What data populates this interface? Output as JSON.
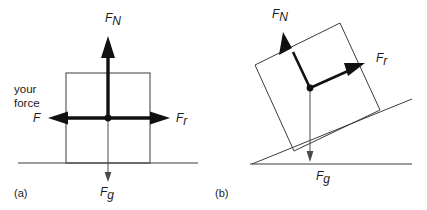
{
  "figure": {
    "background_color": "#ffffff",
    "line_color": "#3b3b3b",
    "bold_arrow_color": "#111111",
    "text_color": "#1a1a1a"
  },
  "panel_a": {
    "tag": "(a)",
    "description": "Box resting on horizontal ground with four forces",
    "annotation_line1": "your",
    "annotation_line2": "force",
    "forces": [
      {
        "id": "normal",
        "symbol": "F",
        "subscript": "N",
        "direction": "up",
        "style": "bold",
        "label_x": 105,
        "label_y": 22
      },
      {
        "id": "applied",
        "symbol": "F",
        "subscript": "",
        "direction": "left",
        "style": "bold",
        "label_x": 33,
        "label_y": 122
      },
      {
        "id": "friction",
        "symbol": "F",
        "subscript": "r",
        "direction": "right",
        "style": "bold",
        "label_x": 176,
        "label_y": 122
      },
      {
        "id": "gravity",
        "symbol": "F",
        "subscript": "g",
        "direction": "down",
        "style": "thin",
        "label_x": 100,
        "label_y": 196
      }
    ],
    "geometry": {
      "box_left": 66,
      "box_top": 73,
      "box_right": 150,
      "box_bottom": 163,
      "center_x": 108,
      "center_y": 118,
      "ground_y": 163,
      "ground_x_start": 18,
      "ground_x_end": 198
    }
  },
  "panel_b": {
    "tag": "(b)",
    "description": "Box on an inclined plane with three forces",
    "incline_angle_deg": 26,
    "forces": [
      {
        "id": "normal",
        "symbol": "F",
        "subscript": "N",
        "direction": "perpendicular-to-incline",
        "style": "bold",
        "label_x": 272,
        "label_y": 18
      },
      {
        "id": "friction",
        "symbol": "F",
        "subscript": "r",
        "direction": "up-slope",
        "style": "bold",
        "label_x": 376,
        "label_y": 62
      },
      {
        "id": "gravity",
        "symbol": "F",
        "subscript": "g",
        "direction": "down",
        "style": "thin",
        "label_x": 316,
        "label_y": 180
      }
    ],
    "geometry": {
      "corner_top_left_x": 255,
      "corner_top_left_y": 65,
      "corner_top_right_x": 340,
      "corner_top_right_y": 23,
      "corner_bottom_right_x": 380,
      "corner_bottom_right_y": 110,
      "corner_bottom_left_x": 294,
      "corner_bottom_left_y": 151,
      "center_x": 310,
      "center_y": 88,
      "incline_x_start": 252,
      "incline_y_start": 164,
      "incline_x_end": 412,
      "incline_y_end": 99,
      "ground_y": 164,
      "ground_x_start": 250,
      "ground_x_end": 412
    }
  }
}
